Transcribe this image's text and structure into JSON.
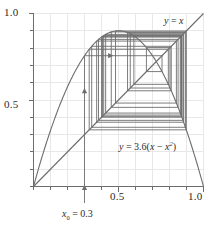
{
  "chart_data": {
    "type": "line",
    "title": "",
    "subtitle": "",
    "xlabel": "",
    "ylabel": "",
    "xlim": [
      0,
      1
    ],
    "ylim": [
      0,
      1
    ],
    "grid": true,
    "legend_position": "inline-annotations",
    "x_ticks": [
      0,
      0.1,
      0.2,
      0.3,
      0.4,
      0.5,
      0.6,
      0.7,
      0.8,
      0.9,
      1.0
    ],
    "y_ticks": [
      0,
      0.1,
      0.2,
      0.3,
      0.4,
      0.5,
      0.6,
      0.7,
      0.8,
      0.9,
      1.0
    ],
    "x_tick_labels": [
      "0.5",
      "1.0"
    ],
    "x_tick_label_values": [
      0.5,
      1.0
    ],
    "y_tick_labels": [
      "0.5",
      "1.0"
    ],
    "y_tick_label_values": [
      0.5,
      1.0
    ],
    "series": [
      {
        "name": "y = 3.6(x - x^2)",
        "kind": "parabola",
        "r": 3.6,
        "vertex": [
          0.5,
          0.9
        ],
        "roots": [
          0.0,
          1.0
        ]
      },
      {
        "name": "y = x",
        "kind": "identity-line",
        "from": [
          0,
          0
        ],
        "to": [
          1,
          1
        ]
      },
      {
        "name": "cobweb-orbit",
        "kind": "cobweb",
        "x0": 0.3,
        "iterates": [
          0.3,
          0.756,
          0.664243,
          0.80305,
          0.569227,
          0.883113,
          0.371572,
          0.840517,
          0.482384,
          0.898762,
          0.327574,
          0.79315,
          0.590505,
          0.870591,
          0.405535,
          0.867802,
          0.413018,
          0.872463,
          0.400505,
          0.863459,
          0.424472,
          0.879238,
          0.382379,
          0.850548,
          0.457455,
          0.893536,
          0.342247,
          0.810335,
          0.553206,
          0.889868
        ]
      }
    ],
    "annotations": [
      {
        "name": "identity-label",
        "text": "y = x",
        "x": 0.88,
        "y": 0.95
      },
      {
        "name": "parabola-label",
        "text": "y = 3.6(x - x^2)",
        "x": 0.56,
        "y": 0.27
      },
      {
        "name": "x0-label",
        "text": "x0 = 0.3",
        "x": 0.3,
        "y": -0.14
      }
    ],
    "arrows": [
      {
        "name": "cobweb-arrow-up",
        "direction": "up",
        "x": 0.3,
        "y": 0.56
      },
      {
        "name": "cobweb-arrow-right",
        "direction": "right",
        "x": 0.46,
        "y": 0.756
      },
      {
        "name": "x0-pointer-arrow",
        "direction": "up",
        "x": 0.3,
        "y": 0.0
      }
    ]
  },
  "axes": {
    "y_top_label": "1.0",
    "y_mid_label": "0.5",
    "x_mid_label": "0.5",
    "x_right_label": "1.0"
  },
  "labels": {
    "identity": {
      "lhs": "y",
      "eq": "=",
      "rhs": "x"
    },
    "parabola": {
      "lhs": "y",
      "eq": "=",
      "coefficient": "3.6",
      "open_paren": "(",
      "term1": "x",
      "minus": "−",
      "term2": "x",
      "exponent": "2",
      "close_paren": ")"
    },
    "initial_value": {
      "symbol": "x",
      "subscript": "0",
      "eq": "=",
      "value": "0.3"
    }
  },
  "colors": {
    "background": "#ffffff",
    "grid": "#e8e8e8",
    "axis": "#6d6d6d",
    "curve": "#6d6d6d",
    "cobweb": "#6d6d6d",
    "text": "#2b2b2b"
  }
}
